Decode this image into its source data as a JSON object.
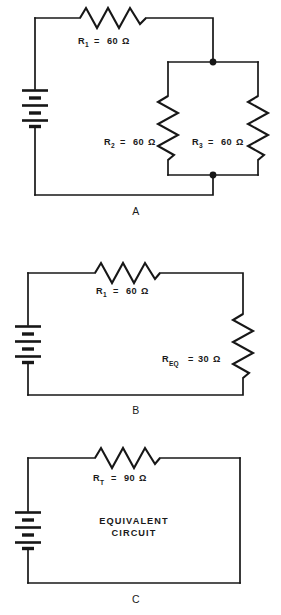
{
  "figure": {
    "background_color": "#ffffff",
    "line_color": "#171717"
  },
  "panels": [
    {
      "id": "A",
      "letter": "A",
      "description": "Original series-parallel circuit with R1 in series with parallel pair R2 and R3",
      "components": [
        {
          "name": "battery",
          "type": "battery",
          "cells": 2
        },
        {
          "name": "R1",
          "type": "resistor",
          "orientation": "horizontal",
          "label_main": "R",
          "label_sub": "1",
          "label_eq": "=",
          "label_value": "60",
          "label_unit": "Ω",
          "label_full": "R₁ = 60 Ω"
        },
        {
          "name": "R2",
          "type": "resistor",
          "orientation": "vertical",
          "label_main": "R",
          "label_sub": "2",
          "label_eq": "=",
          "label_value": "60",
          "label_unit": "Ω",
          "label_full": "R₂ = 60 Ω"
        },
        {
          "name": "R3",
          "type": "resistor",
          "orientation": "vertical",
          "label_main": "R",
          "label_sub": "3",
          "label_eq": "=",
          "label_value": "60",
          "label_unit": "Ω",
          "label_full": "R₃ = 60 Ω"
        }
      ],
      "junction_dots": 2
    },
    {
      "id": "B",
      "letter": "B",
      "description": "Reduced circuit with R1 in series with equivalent resistance of the parallel pair",
      "components": [
        {
          "name": "battery",
          "type": "battery",
          "cells": 2
        },
        {
          "name": "R1",
          "type": "resistor",
          "orientation": "horizontal",
          "label_main": "R",
          "label_sub": "1",
          "label_eq": "=",
          "label_value": "60",
          "label_unit": "Ω",
          "label_full": "R₁ = 60 Ω"
        },
        {
          "name": "REQ",
          "type": "resistor",
          "orientation": "vertical",
          "label_main": "R",
          "label_sub": "EQ",
          "label_eq": "=",
          "label_value": "30",
          "label_unit": "Ω",
          "label_full": "R_EQ = 30 Ω"
        }
      ],
      "junction_dots": 0
    },
    {
      "id": "C",
      "letter": "C",
      "description": "Final equivalent circuit with single total resistance",
      "components": [
        {
          "name": "battery",
          "type": "battery",
          "cells": 2
        },
        {
          "name": "RT",
          "type": "resistor",
          "orientation": "horizontal",
          "label_main": "R",
          "label_sub": "T",
          "label_eq": "=",
          "label_value": "90",
          "label_unit": "Ω",
          "label_full": "R_T = 90 Ω"
        }
      ],
      "annotation_line1": "EQUIVALENT",
      "annotation_line2": "CIRCUIT",
      "junction_dots": 0
    }
  ]
}
